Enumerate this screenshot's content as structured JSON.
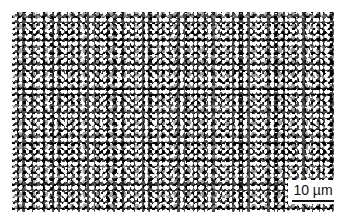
{
  "image": {
    "subject": "micrograph",
    "scale_bar": {
      "label": "10 µm"
    }
  }
}
